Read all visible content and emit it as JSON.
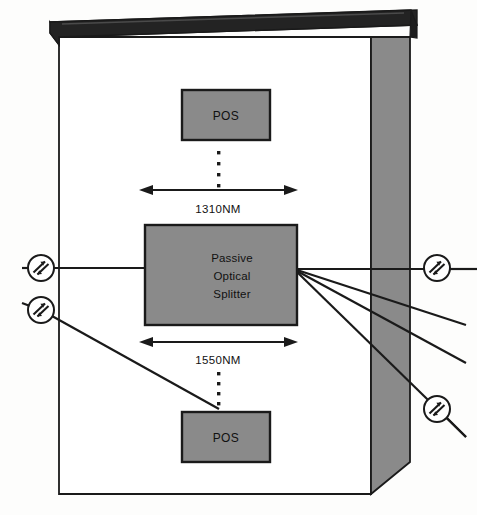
{
  "diagram": {
    "colors": {
      "background": "#fdfdfc",
      "cabinet_face": "#ffffff",
      "cabinet_side_panel": "#8a8a8a",
      "cabinet_top": "#232323",
      "box_fill": "#8a8a8a",
      "stroke": "#1a1a1a",
      "text": "#111111"
    },
    "cabinet": {
      "name": "equipment-cabinet",
      "top_face_name": "cabinet-top-slab",
      "side_face_name": "cabinet-right-side-panel",
      "front_face_name": "cabinet-front-face"
    },
    "boxes": [
      {
        "id": "pos-top",
        "label": "POS",
        "x": 182,
        "y": 90,
        "w": 88,
        "h": 50
      },
      {
        "id": "splitter",
        "label_lines": [
          "Passive",
          "Optical",
          "Splitter"
        ],
        "x": 145,
        "y": 225,
        "w": 152,
        "h": 100
      },
      {
        "id": "pos-bottom",
        "label": "POS",
        "x": 182,
        "y": 412,
        "w": 88,
        "h": 50
      }
    ],
    "dimension_arrows": [
      {
        "id": "wavelength-1310",
        "label": "1310NM",
        "x1": 141,
        "x2": 296,
        "y": 190,
        "label_x": 218,
        "label_y": 213
      },
      {
        "id": "wavelength-1550",
        "label": "1550NM",
        "x1": 141,
        "x2": 296,
        "y": 342,
        "label_x": 218,
        "label_y": 364
      }
    ],
    "dot_columns": [
      {
        "id": "dots-top",
        "x": 219,
        "ys": [
          152,
          163,
          174,
          185
        ]
      },
      {
        "id": "dots-bottom",
        "ys": [
          373,
          383,
          393,
          403
        ],
        "x": 219
      }
    ],
    "connectors": [
      {
        "id": "connector-left-upper",
        "cx": 41,
        "cy": 268,
        "r": 13
      },
      {
        "id": "connector-left-lower",
        "cx": 41,
        "cy": 310,
        "r": 13
      },
      {
        "id": "connector-right-upper",
        "cx": 437,
        "cy": 268,
        "r": 13
      },
      {
        "id": "connector-right-lower",
        "cx": 437,
        "cy": 409,
        "r": 13
      }
    ],
    "fiber_lines": [
      {
        "id": "fiber-input-1310",
        "from": "connector-left-upper",
        "to": "splitter-left-edge"
      },
      {
        "id": "fiber-input-1550",
        "from": "connector-left-lower",
        "to": "pos-bottom"
      },
      {
        "id": "fiber-output-1",
        "from": "splitter-right-edge",
        "to": "connector-right-upper"
      },
      {
        "id": "fiber-output-2",
        "from": "splitter-right-edge",
        "to": "right-open-end-upper"
      },
      {
        "id": "fiber-output-3",
        "from": "splitter-right-edge",
        "to": "right-open-end-lower"
      },
      {
        "id": "fiber-output-4",
        "from": "splitter-right-edge",
        "to": "connector-right-lower"
      }
    ]
  }
}
